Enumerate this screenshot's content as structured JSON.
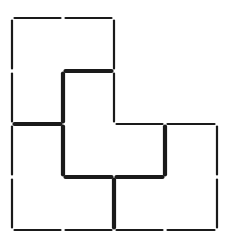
{
  "diagram": {
    "type": "matchstick-puzzle",
    "grid": {
      "x": [
        12,
        63,
        114,
        165,
        217
      ],
      "y": [
        18,
        71,
        124,
        177,
        230
      ]
    },
    "colors": {
      "stick": "#1a1a1a",
      "background": "#ffffff"
    },
    "sticks": [
      {
        "x1": 0,
        "y1": 0,
        "x2": 1,
        "y2": 0,
        "bold": false
      },
      {
        "x1": 1,
        "y1": 0,
        "x2": 2,
        "y2": 0,
        "bold": false
      },
      {
        "x1": 0,
        "y1": 0,
        "x2": 0,
        "y2": 1,
        "bold": false
      },
      {
        "x1": 0,
        "y1": 1,
        "x2": 0,
        "y2": 2,
        "bold": false
      },
      {
        "x1": 0,
        "y1": 2,
        "x2": 0,
        "y2": 3,
        "bold": false
      },
      {
        "x1": 0,
        "y1": 3,
        "x2": 0,
        "y2": 4,
        "bold": false
      },
      {
        "x1": 2,
        "y1": 0,
        "x2": 2,
        "y2": 1,
        "bold": false
      },
      {
        "x1": 2,
        "y1": 1,
        "x2": 2,
        "y2": 2,
        "bold": false
      },
      {
        "x1": 1,
        "y1": 1,
        "x2": 2,
        "y2": 1,
        "bold": true
      },
      {
        "x1": 1,
        "y1": 1,
        "x2": 1,
        "y2": 2,
        "bold": true
      },
      {
        "x1": 1,
        "y1": 2,
        "x2": 1,
        "y2": 3,
        "bold": true
      },
      {
        "x1": 0,
        "y1": 2,
        "x2": 1,
        "y2": 2,
        "bold": true
      },
      {
        "x1": 2,
        "y1": 2,
        "x2": 3,
        "y2": 2,
        "bold": false
      },
      {
        "x1": 3,
        "y1": 2,
        "x2": 4,
        "y2": 2,
        "bold": false
      },
      {
        "x1": 3,
        "y1": 2,
        "x2": 3,
        "y2": 3,
        "bold": true
      },
      {
        "x1": 1,
        "y1": 3,
        "x2": 2,
        "y2": 3,
        "bold": true
      },
      {
        "x1": 2,
        "y1": 3,
        "x2": 3,
        "y2": 3,
        "bold": true
      },
      {
        "x1": 4,
        "y1": 2,
        "x2": 4,
        "y2": 3,
        "bold": false
      },
      {
        "x1": 4,
        "y1": 3,
        "x2": 4,
        "y2": 4,
        "bold": false
      },
      {
        "x1": 2,
        "y1": 3,
        "x2": 2,
        "y2": 4,
        "bold": true
      },
      {
        "x1": 0,
        "y1": 4,
        "x2": 1,
        "y2": 4,
        "bold": false
      },
      {
        "x1": 1,
        "y1": 4,
        "x2": 2,
        "y2": 4,
        "bold": false
      },
      {
        "x1": 2,
        "y1": 4,
        "x2": 3,
        "y2": 4,
        "bold": false
      },
      {
        "x1": 3,
        "y1": 4,
        "x2": 4,
        "y2": 4,
        "bold": false
      }
    ]
  }
}
